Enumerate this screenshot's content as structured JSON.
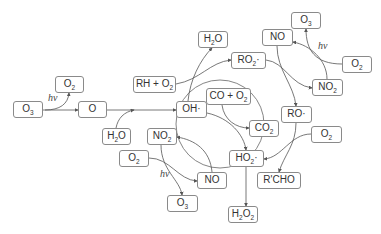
{
  "diagram": {
    "title": "",
    "nodes": [
      {
        "id": "o3-left",
        "label": "O",
        "sub": "3",
        "x": 13,
        "y": 101,
        "w": 30,
        "h": 17
      },
      {
        "id": "o2-topleft",
        "label": "O",
        "sub": "2",
        "x": 55,
        "y": 76,
        "w": 29,
        "h": 17
      },
      {
        "id": "o-atom",
        "label": "O",
        "sub": "",
        "x": 78,
        "y": 101,
        "w": 29,
        "h": 17
      },
      {
        "id": "rh-o2",
        "label": "RH + O",
        "sub": "2",
        "x": 133,
        "y": 76,
        "w": 43,
        "h": 17
      },
      {
        "id": "h2o-top",
        "label": "H",
        "sub": "2",
        "after": "O",
        "x": 198,
        "y": 31,
        "w": 30,
        "h": 17
      },
      {
        "id": "ro2-radical",
        "label": "RO",
        "sub": "2",
        "after": "·",
        "x": 231,
        "y": 52,
        "w": 35,
        "h": 17
      },
      {
        "id": "no-top",
        "label": "NO",
        "sub": "",
        "x": 262,
        "y": 29,
        "w": 31,
        "h": 17
      },
      {
        "id": "o3-topright",
        "label": "O",
        "sub": "3",
        "x": 291,
        "y": 12,
        "w": 30,
        "h": 17
      },
      {
        "id": "o2-right",
        "label": "O",
        "sub": "2",
        "x": 342,
        "y": 56,
        "w": 30,
        "h": 17
      },
      {
        "id": "no2-right",
        "label": "NO",
        "sub": "2",
        "x": 312,
        "y": 79,
        "w": 31,
        "h": 17
      },
      {
        "id": "oh-radical",
        "label": "OH·",
        "sub": "",
        "x": 176,
        "y": 101,
        "w": 31,
        "h": 17
      },
      {
        "id": "co-o2",
        "label": "CO + O",
        "sub": "2",
        "x": 206,
        "y": 88,
        "w": 45,
        "h": 17
      },
      {
        "id": "ro-radical",
        "label": "RO·",
        "sub": "",
        "x": 281,
        "y": 106,
        "w": 31,
        "h": 17
      },
      {
        "id": "h2o-bottomleft",
        "label": "H",
        "sub": "2",
        "after": "O",
        "x": 102,
        "y": 128,
        "w": 29,
        "h": 17
      },
      {
        "id": "no2-bottomleft",
        "label": "NO",
        "sub": "2",
        "x": 147,
        "y": 128,
        "w": 30,
        "h": 17
      },
      {
        "id": "co2",
        "label": "CO",
        "sub": "2",
        "x": 249,
        "y": 120,
        "w": 30,
        "h": 17
      },
      {
        "id": "o2-farright",
        "label": "O",
        "sub": "2",
        "x": 311,
        "y": 126,
        "w": 31,
        "h": 17
      },
      {
        "id": "o2-bottomleft",
        "label": "O",
        "sub": "2",
        "x": 119,
        "y": 150,
        "w": 30,
        "h": 17
      },
      {
        "id": "ho2-radical",
        "label": "HO",
        "sub": "2",
        "after": "·",
        "x": 229,
        "y": 150,
        "w": 35,
        "h": 17
      },
      {
        "id": "no-bottom",
        "label": "NO",
        "sub": "",
        "x": 197,
        "y": 172,
        "w": 30,
        "h": 17
      },
      {
        "id": "rcho",
        "label": "R'CHO",
        "sub": "",
        "x": 257,
        "y": 172,
        "w": 44,
        "h": 17
      },
      {
        "id": "o3-bottom",
        "label": "O",
        "sub": "3",
        "x": 167,
        "y": 195,
        "w": 31,
        "h": 17
      },
      {
        "id": "h2o2",
        "label": "H",
        "sub": "2",
        "after": "O",
        "sub2": "2",
        "x": 228,
        "y": 206,
        "w": 30,
        "h": 17
      }
    ],
    "photolysis_labels": [
      {
        "id": "hv-left",
        "text": "hν",
        "x": 48,
        "y": 92
      },
      {
        "id": "hv-topright",
        "text": "hν",
        "x": 318,
        "y": 40
      },
      {
        "id": "hv-bottom",
        "text": "hν",
        "x": 160,
        "y": 168
      }
    ],
    "edges": [
      {
        "from": "o3-left",
        "to": "o-atom"
      },
      {
        "from": "o3-left",
        "to": "o2-topleft",
        "label": "hν"
      },
      {
        "from": "o-atom",
        "to": "oh-radical"
      },
      {
        "from": "h2o-bottomleft",
        "to": "oh-radical"
      },
      {
        "from": "oh-radical",
        "to": "h2o-top"
      },
      {
        "from": "rh-o2",
        "to": "ro2-radical"
      },
      {
        "from": "ro2-radical",
        "to": "no2-right"
      },
      {
        "from": "no-top",
        "to": "ro-radical"
      },
      {
        "from": "no2-right",
        "to": "no-top",
        "label": "hν"
      },
      {
        "from": "o2-right",
        "to": "o3-topright"
      },
      {
        "from": "oh-radical",
        "to": "ho2-radical"
      },
      {
        "from": "co-o2",
        "to": "co2"
      },
      {
        "from": "ro-radical",
        "to": "rcho"
      },
      {
        "from": "o2-farright",
        "to": "ho2-radical"
      },
      {
        "from": "ho2-radical",
        "to": "oh-radical"
      },
      {
        "from": "no-bottom",
        "to": "no2-bottomleft"
      },
      {
        "from": "no2-bottomleft",
        "to": "o3-bottom",
        "label": "hν"
      },
      {
        "from": "o2-bottomleft",
        "to": "no-bottom"
      },
      {
        "from": "ho2-radical",
        "to": "h2o2"
      }
    ]
  }
}
